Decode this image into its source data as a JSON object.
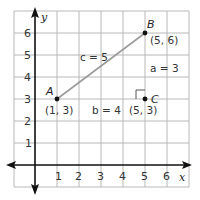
{
  "diagram": {
    "type": "coordinate-plane-right-triangle",
    "axes": {
      "x_label": "x",
      "y_label": "y",
      "x_ticks": [
        "1",
        "2",
        "3",
        "4",
        "5",
        "6"
      ],
      "y_ticks": [
        "1",
        "2",
        "3",
        "4",
        "5",
        "6"
      ]
    },
    "points": {
      "A": {
        "name": "A",
        "coords": "(1, 3)"
      },
      "B": {
        "name": "B",
        "coords": "(5, 6)"
      },
      "C": {
        "name": "C",
        "coords": "(5, 3)"
      }
    },
    "sides": {
      "a": "a = 3",
      "b": "b = 4",
      "c": "c = 5"
    },
    "colors": {
      "grid": "#b8b8b8",
      "axis": "#111111",
      "hypotenuse": "#9a9a9a"
    }
  }
}
